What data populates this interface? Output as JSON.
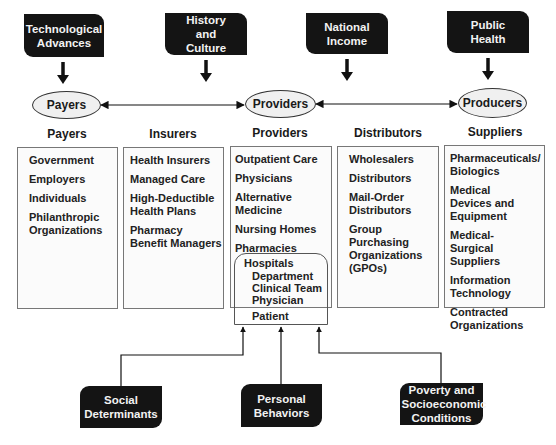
{
  "top_factors": [
    {
      "label": "Technological Advances"
    },
    {
      "label": "History and Culture"
    },
    {
      "label": "National Income"
    },
    {
      "label": "Public Health"
    }
  ],
  "nodes": {
    "payers": "Payers",
    "providers": "Providers",
    "producers": "Producers"
  },
  "columns": [
    {
      "title": "Payers",
      "items": [
        "Government",
        "Employers",
        "Individuals",
        "Philanthropic Organizations"
      ]
    },
    {
      "title": "Insurers",
      "items": [
        "Health Insurers",
        "Managed Care",
        "High-Deductible Health Plans",
        "Pharmacy Benefit Managers"
      ]
    },
    {
      "title": "Providers",
      "items": [
        "Outpatient Care",
        "Physicians",
        "Alternative Medicine",
        "Nursing Homes",
        "Pharmacies"
      ]
    },
    {
      "title": "Distributors",
      "items": [
        "Wholesalers",
        "Distributors",
        "Mail-Order Distributors",
        "Group Purchasing Organizations (GPOs)"
      ]
    },
    {
      "title": "Suppliers",
      "items": [
        "Pharmaceuticals/ Biologics",
        "Medical Devices and Equipment",
        "Medical-Surgical Suppliers",
        "Information Technology",
        "Contracted Organizations"
      ]
    }
  ],
  "hospital": {
    "label": "Hospitals",
    "levels": [
      "Department",
      "Clinical Team",
      "Physician"
    ],
    "patient": "Patient"
  },
  "bottom_factors": [
    {
      "label": "Social Determinants"
    },
    {
      "label": "Personal Behaviors"
    },
    {
      "label": "Poverty and Socioeconomic Conditions"
    }
  ]
}
